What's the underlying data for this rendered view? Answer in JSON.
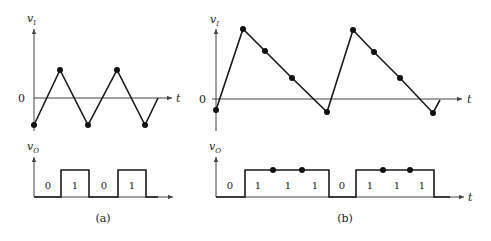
{
  "colors": {
    "ink": "#1a1a1a",
    "axis": "#444444",
    "background": "#ffffff"
  },
  "panel_a": {
    "caption": "(a)",
    "top": {
      "y_label": "v",
      "y_sub": "I",
      "x_label": "t",
      "zero_label": "0"
    },
    "bottom": {
      "y_label": "v",
      "y_sub": "O",
      "x_label": "t",
      "bits": [
        "0",
        "1",
        "0",
        "1"
      ]
    }
  },
  "panel_b": {
    "caption": "(b)",
    "top": {
      "y_label": "v",
      "y_sub": "I",
      "x_label": "t",
      "zero_label": "0"
    },
    "bottom": {
      "y_label": "v",
      "y_sub": "O",
      "x_label": "t",
      "bits": [
        "0",
        "1",
        "1",
        "1",
        "0",
        "1",
        "1",
        "1"
      ]
    }
  }
}
